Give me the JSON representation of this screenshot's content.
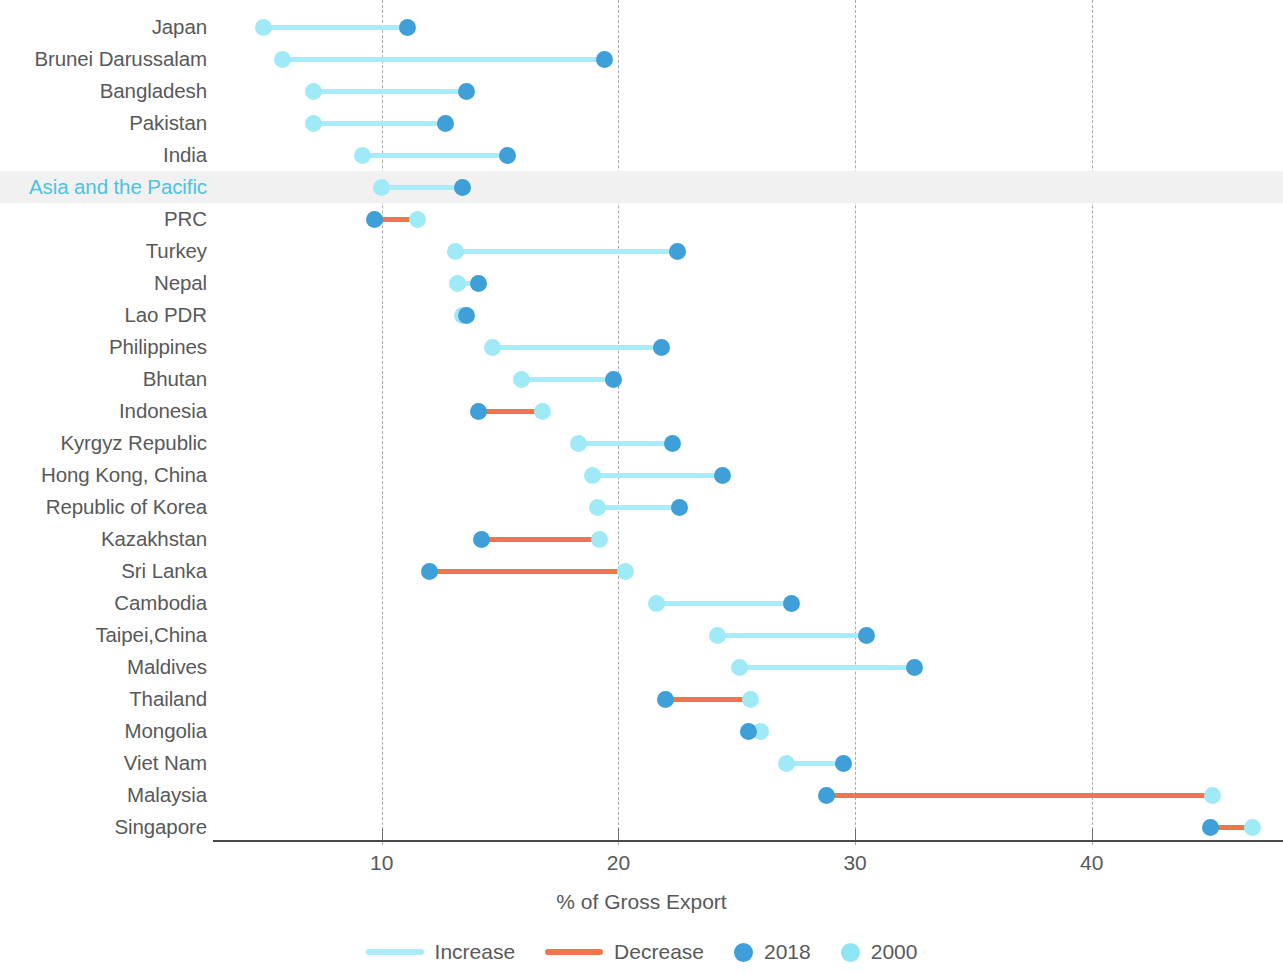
{
  "chart_data": {
    "type": "dumbbell",
    "title": "",
    "xlabel": "% of Gross Export",
    "ylabel": "",
    "xlim": [
      3.5,
      48
    ],
    "xticks": [
      10,
      20,
      30,
      40
    ],
    "grid": "vertical-dashed",
    "legend_position": "bottom",
    "series": [
      {
        "name": "2018",
        "color": "#3f9fd8"
      },
      {
        "name": "2000",
        "color": "#8fe4f5"
      }
    ],
    "change_colors": {
      "increase": "#a9ecf7",
      "decrease": "#f2744d"
    },
    "highlight_row": "Asia and the Pacific",
    "highlight_color": "#4cc3e0",
    "categories": [
      "Japan",
      "Brunei Darussalam",
      "Bangladesh",
      "Pakistan",
      "India",
      "Asia and the Pacific",
      "PRC",
      "Turkey",
      "Nepal",
      "Lao PDR",
      "Philippines",
      "Bhutan",
      "Indonesia",
      "Kyrgyz Republic",
      "Hong Kong, China",
      "Republic of Korea",
      "Kazakhstan",
      "Sri Lanka",
      "Cambodia",
      "Taipei,China",
      "Maldives",
      "Thailand",
      "Mongolia",
      "Viet Nam",
      "Malaysia",
      "Singapore"
    ],
    "rows": [
      {
        "label": "Japan",
        "v2000": 5.0,
        "v2018": 11.1,
        "direction": "increase"
      },
      {
        "label": "Brunei Darussalam",
        "v2000": 5.8,
        "v2018": 19.4,
        "direction": "increase"
      },
      {
        "label": "Bangladesh",
        "v2000": 7.1,
        "v2018": 13.6,
        "direction": "increase"
      },
      {
        "label": "Pakistan",
        "v2000": 7.1,
        "v2018": 12.7,
        "direction": "increase"
      },
      {
        "label": "India",
        "v2000": 9.2,
        "v2018": 15.3,
        "direction": "increase"
      },
      {
        "label": "Asia and the Pacific",
        "v2000": 10.0,
        "v2018": 13.4,
        "direction": "increase"
      },
      {
        "label": "PRC",
        "v2000": 11.5,
        "v2018": 9.7,
        "direction": "decrease"
      },
      {
        "label": "Turkey",
        "v2000": 13.1,
        "v2018": 22.5,
        "direction": "increase"
      },
      {
        "label": "Nepal",
        "v2000": 13.2,
        "v2018": 14.1,
        "direction": "increase"
      },
      {
        "label": "Lao PDR",
        "v2000": 13.4,
        "v2018": 13.6,
        "direction": "increase"
      },
      {
        "label": "Philippines",
        "v2000": 14.7,
        "v2018": 21.8,
        "direction": "increase"
      },
      {
        "label": "Bhutan",
        "v2000": 15.9,
        "v2018": 19.8,
        "direction": "increase"
      },
      {
        "label": "Indonesia",
        "v2000": 16.8,
        "v2018": 14.1,
        "direction": "decrease"
      },
      {
        "label": "Kyrgyz Republic",
        "v2000": 18.3,
        "v2018": 22.3,
        "direction": "increase"
      },
      {
        "label": "Hong Kong, China",
        "v2000": 18.9,
        "v2018": 24.4,
        "direction": "increase"
      },
      {
        "label": "Republic of Korea",
        "v2000": 19.1,
        "v2018": 22.6,
        "direction": "increase"
      },
      {
        "label": "Kazakhstan",
        "v2000": 19.2,
        "v2018": 14.2,
        "direction": "decrease"
      },
      {
        "label": "Sri Lanka",
        "v2000": 20.3,
        "v2018": 12.0,
        "direction": "decrease"
      },
      {
        "label": "Cambodia",
        "v2000": 21.6,
        "v2018": 27.3,
        "direction": "increase"
      },
      {
        "label": "Taipei,China",
        "v2000": 24.2,
        "v2018": 30.5,
        "direction": "increase"
      },
      {
        "label": "Maldives",
        "v2000": 25.1,
        "v2018": 32.5,
        "direction": "increase"
      },
      {
        "label": "Thailand",
        "v2000": 25.6,
        "v2018": 22.0,
        "direction": "decrease"
      },
      {
        "label": "Mongolia",
        "v2000": 26.0,
        "v2018": 25.5,
        "direction": "decrease"
      },
      {
        "label": "Viet Nam",
        "v2000": 27.1,
        "v2018": 29.5,
        "direction": "increase"
      },
      {
        "label": "Malaysia",
        "v2000": 45.1,
        "v2018": 28.8,
        "direction": "decrease"
      },
      {
        "label": "Singapore",
        "v2000": 46.8,
        "v2018": 45.0,
        "direction": "decrease"
      }
    ]
  },
  "axis": {
    "tick_labels": [
      "10",
      "20",
      "30",
      "40"
    ],
    "title": "% of Gross Export"
  },
  "legend": {
    "items": [
      {
        "label": "Increase",
        "kind": "line",
        "color": "#a9ecf7"
      },
      {
        "label": "Decrease",
        "kind": "line",
        "color": "#f2744d"
      },
      {
        "label": "2018",
        "kind": "dot",
        "color": "#3f9fd8"
      },
      {
        "label": "2000",
        "kind": "dot",
        "color": "#8fe4f5"
      }
    ]
  }
}
